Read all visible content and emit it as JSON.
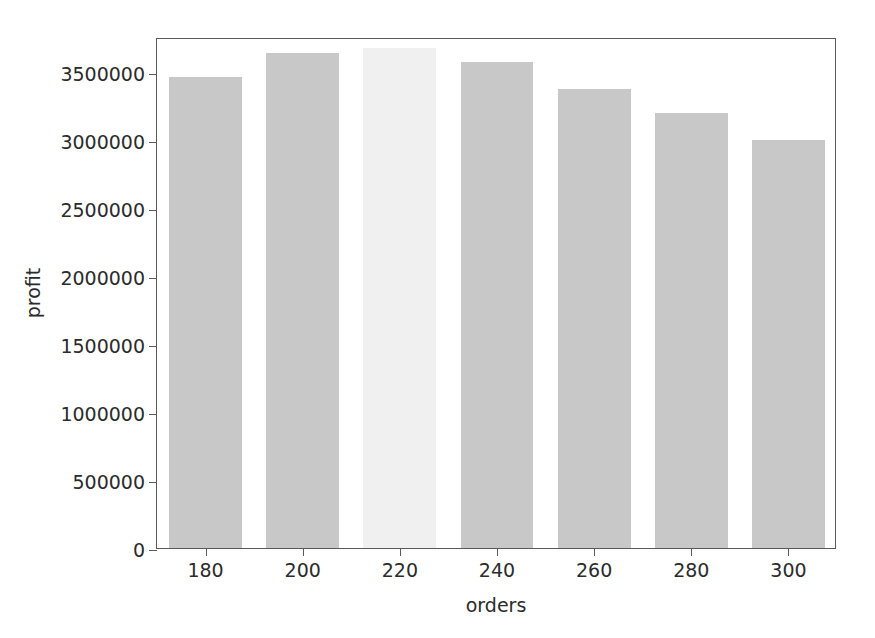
{
  "chart_data": {
    "type": "bar",
    "title": "",
    "xlabel": "orders",
    "ylabel": "profit",
    "categories": [
      "180",
      "200",
      "220",
      "240",
      "260",
      "280",
      "300"
    ],
    "values": [
      3467000,
      3643000,
      3676000,
      3575000,
      3380000,
      3200000,
      3000000
    ],
    "series": [
      {
        "name": "profit",
        "values": [
          3467000,
          3643000,
          3676000,
          3575000,
          3380000,
          3200000,
          3000000
        ]
      }
    ],
    "bar_colors": [
      "#c8c8c8",
      "#c8c8c8",
      "#f0f0f0",
      "#c8c8c8",
      "#c8c8c8",
      "#c8c8c8",
      "#c8c8c8"
    ],
    "highlighted_category": "220",
    "ylim": [
      0,
      3760000
    ],
    "xlim": [
      170,
      310
    ],
    "ytick_values": [
      0,
      500000,
      1000000,
      1500000,
      2000000,
      2500000,
      3000000,
      3500000
    ],
    "ytick_labels": [
      "0",
      "500000",
      "1000000",
      "1500000",
      "2000000",
      "2500000",
      "3000000",
      "3500000"
    ],
    "xtick_values": [
      180,
      200,
      220,
      240,
      260,
      280,
      300
    ],
    "xtick_labels": [
      "180",
      "200",
      "220",
      "240",
      "260",
      "280",
      "300"
    ],
    "grid": false,
    "legend": null,
    "legend_position": "none",
    "bar_width": 15,
    "background_color": "#ffffff",
    "axis_color": "#5b5b5b",
    "text_color": "#2b2b2b"
  }
}
